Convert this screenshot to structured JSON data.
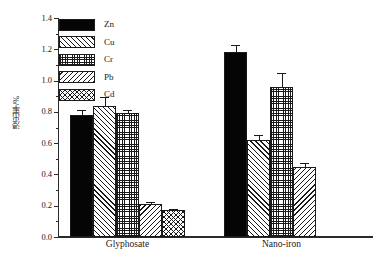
{
  "chart_data": {
    "type": "bar",
    "title": "",
    "xlabel": "",
    "ylabel": "浸出率/%",
    "ylim": [
      0.0,
      1.4
    ],
    "ytick_labels": [
      "0.0",
      "0.2",
      "0.4",
      "0.6",
      "0.8",
      "1.0",
      "1.2",
      "1.4"
    ],
    "ytick_values": [
      0.0,
      0.2,
      0.4,
      0.6,
      0.8,
      1.0,
      1.2,
      1.4
    ],
    "grid": false,
    "legend_position": "upper-left",
    "categories": [
      "Glyphosate",
      "Nano-iron"
    ],
    "series": [
      {
        "name": "Zn",
        "pattern": "solid-black",
        "values": [
          0.78,
          1.18
        ],
        "errors": [
          0.035,
          0.045
        ]
      },
      {
        "name": "Cu",
        "pattern": "forward-diagonal",
        "values": [
          0.84,
          0.62
        ],
        "errors": [
          0.055,
          0.03
        ]
      },
      {
        "name": "Cr",
        "pattern": "dense-grid",
        "values": [
          0.79,
          0.96
        ],
        "errors": [
          0.022,
          0.09
        ]
      },
      {
        "name": "Pb",
        "pattern": "backward-diagonal",
        "values": [
          0.21,
          0.45
        ],
        "errors": [
          0.015,
          0.025
        ]
      },
      {
        "name": "Cd",
        "pattern": "cross-hatch",
        "values": [
          0.17,
          0.0
        ],
        "errors": [
          0.012,
          0.0
        ]
      }
    ]
  },
  "legend": {
    "items": [
      {
        "label": "Zn"
      },
      {
        "label": "Cu"
      },
      {
        "label": "Cr"
      },
      {
        "label": "Pb"
      },
      {
        "label": "Cd"
      }
    ]
  }
}
